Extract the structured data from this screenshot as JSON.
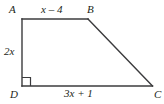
{
  "figure": {
    "type": "right-trapezoid",
    "name": "trapezoid-ABCD",
    "stroke_color": "#3b3b3d",
    "text_color": "#231f20",
    "background_color": "#ffffff",
    "vertices": {
      "A": {
        "label": "A",
        "x": 22,
        "y": 19
      },
      "B": {
        "label": "B",
        "x": 88,
        "y": 19
      },
      "C": {
        "label": "C",
        "x": 152,
        "y": 86
      },
      "D": {
        "label": "D",
        "x": 22,
        "y": 86
      }
    },
    "sides": {
      "top": {
        "name": "AB",
        "label": "x – 4"
      },
      "left": {
        "name": "AD",
        "label": "2x"
      },
      "bottom": {
        "name": "DC",
        "label": "3x + 1"
      },
      "diagonal": {
        "name": "BC",
        "label": ""
      }
    },
    "marks": {
      "right_angle": {
        "at_vertex": "D",
        "name": "right-angle-mark",
        "size": 8
      }
    }
  }
}
